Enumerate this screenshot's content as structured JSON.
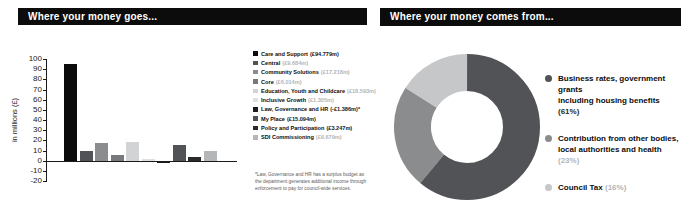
{
  "left_panel": {
    "title": "Where your money goes...",
    "ylabel": "in millions (£)",
    "legend": [
      {
        "label": "Care and Support",
        "value": "(£94.779m)",
        "color": "#0b0b0b",
        "muted": false
      },
      {
        "label": "Central",
        "value": "(£9.684m)",
        "color": "#515356",
        "muted": true
      },
      {
        "label": "Community Solutions",
        "value": "(£17.218m)",
        "color": "#8a8c8e",
        "muted": true
      },
      {
        "label": "Core",
        "value": "(£6.014m)",
        "color": "#77797c",
        "muted": true
      },
      {
        "label": "Education, Youth and Childcare",
        "value": "(£18.593m)",
        "color": "#d2d3d4",
        "muted": true
      },
      {
        "label": "Inclusive Growth",
        "value": "(£1.305m)",
        "color": "#dfe0e1",
        "muted": true
      },
      {
        "label": "Law, Governance and HR",
        "value": "(-£1.386m)*",
        "color": "#1c1c1c",
        "muted": false
      },
      {
        "label": "My Place",
        "value": "(£15.094m)",
        "color": "#515356",
        "muted": false
      },
      {
        "label": "Policy and Participation",
        "value": "(£3.247m)",
        "color": "#2a2a2a",
        "muted": false
      },
      {
        "label": "SDI Commissioning",
        "value": "(£9.679m)",
        "color": "#b5b6b8",
        "muted": true
      }
    ],
    "footnote": "*Law, Governance and HR has a surplus budget as the department generates additional income through enforcement to pay for council-wide services."
  },
  "right_panel": {
    "title": "Where your money comes from...",
    "legend": [
      {
        "line1": "Business rates, government grants",
        "line2": "including housing benefits",
        "pct": "(61%)",
        "color": "#515356",
        "muted": false
      },
      {
        "line1": "Contribution from other bodies,",
        "line2": "local authorities and health",
        "pct": "(23%)",
        "color": "#8a8c8e",
        "muted": true
      },
      {
        "line1": "Council Tax",
        "line2": "",
        "pct": "(16%)",
        "color": "#c6c7c9",
        "muted": true
      }
    ]
  },
  "chart_data": [
    {
      "type": "bar",
      "title": "Where your money goes...",
      "ylabel": "in millions (£)",
      "categories": [
        "Care and Support",
        "Central",
        "Community Solutions",
        "Core",
        "Education, Youth and Childcare",
        "Inclusive Growth",
        "Law, Governance and HR",
        "My Place",
        "Policy and Participation",
        "SDI Commissioning"
      ],
      "values": [
        94.779,
        9.684,
        17.218,
        6.014,
        18.593,
        1.305,
        -1.386,
        15.094,
        3.247,
        9.679
      ],
      "colors": [
        "#0b0b0b",
        "#515356",
        "#8a8c8e",
        "#77797c",
        "#d2d3d4",
        "#dfe0e1",
        "#1c1c1c",
        "#515356",
        "#2a2a2a",
        "#b5b6b8"
      ],
      "ylim": [
        -20,
        100
      ],
      "yticks": [
        100,
        90,
        80,
        70,
        60,
        50,
        40,
        30,
        20,
        10,
        0,
        -10,
        -20
      ],
      "grid": false,
      "legend_position": "right"
    },
    {
      "type": "pie",
      "donut": true,
      "title": "Where your money comes from...",
      "labels": [
        "Business rates, government grants including housing benefits",
        "Contribution from other bodies, local authorities and health",
        "Council Tax"
      ],
      "values": [
        61,
        23,
        16
      ],
      "colors": [
        "#515356",
        "#8a8c8e",
        "#c6c7c9"
      ],
      "legend_position": "right"
    }
  ]
}
